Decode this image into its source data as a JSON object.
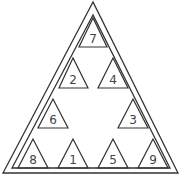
{
  "diagram": {
    "type": "magic-triangle-puzzle",
    "numbers": [
      {
        "id": "top",
        "value": "7",
        "x": 93,
        "y": 38
      },
      {
        "id": "row2-left",
        "value": "2",
        "x": 73,
        "y": 79
      },
      {
        "id": "row2-right",
        "value": "4",
        "x": 113,
        "y": 79
      },
      {
        "id": "row3-left",
        "value": "6",
        "x": 53,
        "y": 119
      },
      {
        "id": "row3-right",
        "value": "3",
        "x": 133,
        "y": 119
      },
      {
        "id": "bottom-1",
        "value": "8",
        "x": 33,
        "y": 159
      },
      {
        "id": "bottom-2",
        "value": "1",
        "x": 73,
        "y": 159
      },
      {
        "id": "bottom-3",
        "value": "5",
        "x": 113,
        "y": 159
      },
      {
        "id": "bottom-4",
        "value": "9",
        "x": 153,
        "y": 159
      }
    ]
  }
}
